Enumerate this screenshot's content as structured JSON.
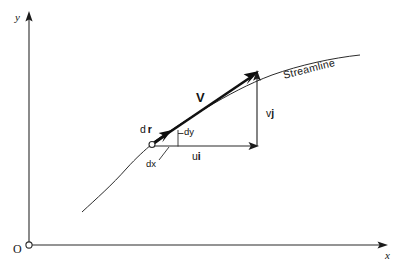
{
  "figure": {
    "kind": "diagram",
    "background_color": "#ffffff",
    "ink_color": "#1a1a1a"
  },
  "axes": {
    "y_label": "y",
    "x_label": "x",
    "origin_label": "O",
    "y_axis": {
      "x": 29,
      "y_bottom": 245,
      "y_top": 13
    },
    "x_axis": {
      "y": 245,
      "x_left": 29,
      "x_right": 388
    }
  },
  "curve": {
    "name": "streamline",
    "label": "Streamline",
    "label_rotation_deg": -14,
    "start": {
      "x": 82,
      "y": 212
    },
    "end": {
      "x": 360,
      "y": 55
    },
    "points": [
      {
        "x": 82,
        "y": 212
      },
      {
        "x": 100,
        "y": 196
      },
      {
        "x": 120,
        "y": 176
      },
      {
        "x": 137,
        "y": 158
      },
      {
        "x": 152,
        "y": 144
      },
      {
        "x": 175,
        "y": 126
      },
      {
        "x": 200,
        "y": 110
      },
      {
        "x": 230,
        "y": 93
      },
      {
        "x": 258,
        "y": 80
      },
      {
        "x": 290,
        "y": 70
      },
      {
        "x": 325,
        "y": 61
      },
      {
        "x": 360,
        "y": 55
      }
    ]
  },
  "point": {
    "name": "point-on-streamline",
    "x": 152,
    "y": 144
  },
  "vectors": {
    "velocity": {
      "label": "V",
      "bold": true,
      "tail": {
        "x": 152,
        "y": 144
      },
      "tip": {
        "x": 258,
        "y": 72
      },
      "label_pos": {
        "x": 198,
        "y": 96
      }
    },
    "displacement": {
      "label_prefix": "d",
      "label_symbol": "r",
      "bold_symbol": true,
      "tail": {
        "x": 152,
        "y": 144
      },
      "tip": {
        "x": 171,
        "y": 131
      },
      "label_pos": {
        "x": 142,
        "y": 129
      }
    },
    "u_component": {
      "label_magnitude": "u",
      "label_unit": "i",
      "tail": {
        "x": 152,
        "y": 146
      },
      "tip": {
        "x": 258,
        "y": 146
      },
      "label_pos": {
        "x": 196,
        "y": 156
      }
    },
    "v_component": {
      "label_magnitude": "v",
      "label_unit": "j",
      "tail": {
        "x": 257,
        "y": 146
      },
      "tip": {
        "x": 257,
        "y": 72
      },
      "label_pos": {
        "x": 266,
        "y": 113
      }
    }
  },
  "differentials": {
    "dx": {
      "label": "dx",
      "label_pos": {
        "x": 148,
        "y": 163
      },
      "leader_from": {
        "x": 160,
        "y": 160
      },
      "leader_to": {
        "x": 170,
        "y": 147
      },
      "segment_from": {
        "x": 152,
        "y": 146
      },
      "segment_to": {
        "x": 178,
        "y": 146
      }
    },
    "dy": {
      "label": "dy",
      "label_pos": {
        "x": 184,
        "y": 131
      },
      "segment_from": {
        "x": 178,
        "y": 146
      },
      "segment_to": {
        "x": 178,
        "y": 131
      },
      "leader_from": {
        "x": 178,
        "y": 134
      },
      "leader_to": {
        "x": 183,
        "y": 134
      }
    }
  },
  "annotations": {
    "streamline_label_pos": {
      "x": 282,
      "y": 68
    }
  }
}
